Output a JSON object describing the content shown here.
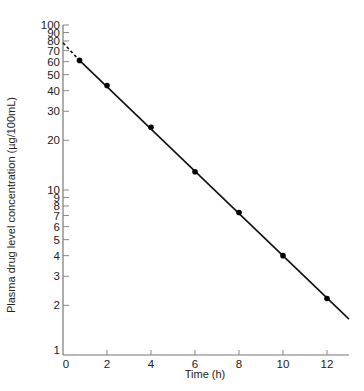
{
  "chart_data": {
    "type": "line",
    "title": "",
    "xlabel": "Time (h)",
    "ylabel": "Plasma drug level concentration (µg/100mL)",
    "yscale": "log",
    "xlim": [
      0,
      13
    ],
    "ylim": [
      1,
      100
    ],
    "grid": false,
    "legend": null,
    "x_ticks": [
      0,
      2,
      4,
      6,
      8,
      10,
      12
    ],
    "y_ticks": [
      1,
      2,
      3,
      4,
      5,
      6,
      7,
      8,
      9,
      10,
      20,
      30,
      40,
      50,
      60,
      70,
      80,
      90,
      100
    ],
    "y_tick_labels": [
      "1",
      "2",
      "3",
      "4",
      "5",
      "6",
      "7",
      "8",
      "9",
      "10",
      "20",
      "30",
      "40",
      "50",
      "60",
      "70",
      "80",
      "90",
      "100"
    ],
    "series": [
      {
        "name": "Measured plasma concentration",
        "marker": "filled-circle",
        "x": [
          0.75,
          2,
          4,
          6,
          8,
          10,
          12
        ],
        "values": [
          61,
          43,
          24,
          12.9,
          7.3,
          4.0,
          2.2
        ]
      }
    ],
    "fit_line": {
      "style": "solid",
      "x": [
        0.75,
        13
      ],
      "values": [
        61,
        1.65
      ]
    },
    "extrapolation": {
      "style": "dashed",
      "x": [
        0,
        0.75
      ],
      "values": [
        78,
        61
      ],
      "note": "back-extrapolated to y-intercept"
    }
  }
}
